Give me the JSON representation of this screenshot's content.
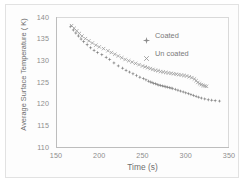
{
  "chart_data": {
    "type": "scatter",
    "title": "",
    "xlabel": "Time (s)",
    "ylabel": "Average Surface Temperature ( K)",
    "xlim": [
      150,
      350
    ],
    "ylim": [
      110,
      140
    ],
    "xticks": [
      150,
      200,
      250,
      300,
      350
    ],
    "yticks": [
      110,
      115,
      120,
      125,
      130,
      135,
      140
    ],
    "grid": false,
    "legend_position": "upper-right-inside",
    "series": [
      {
        "name": "Coated",
        "marker": "diamond",
        "color": "#808080",
        "x": [
          167,
          170,
          173,
          176,
          179,
          182,
          186,
          190,
          194,
          198,
          203,
          208,
          212,
          217,
          222,
          227,
          231,
          235,
          239,
          243,
          247,
          251,
          254,
          257,
          259,
          261,
          263,
          265,
          267,
          269,
          271,
          273,
          275,
          277,
          279,
          281,
          283,
          285,
          288,
          291,
          294,
          297,
          300,
          303,
          306,
          309,
          312,
          315,
          318,
          322,
          326,
          330,
          334,
          339
        ],
        "y": [
          137.8,
          137.0,
          136.3,
          135.6,
          134.9,
          134.3,
          133.6,
          132.9,
          132.3,
          131.8,
          131.3,
          130.7,
          130.2,
          129.4,
          128.7,
          128.2,
          127.7,
          127.3,
          126.9,
          126.5,
          126.1,
          125.8,
          125.5,
          125.2,
          125.0,
          124.9,
          124.7,
          124.6,
          124.4,
          124.3,
          124.2,
          124.1,
          124.0,
          123.9,
          123.8,
          123.7,
          123.6,
          123.5,
          123.3,
          123.1,
          122.9,
          122.7,
          122.5,
          122.3,
          122.1,
          121.9,
          121.7,
          121.5,
          121.3,
          121.1,
          120.9,
          120.8,
          120.7,
          120.6
        ]
      },
      {
        "name": "Un coated",
        "marker": "x",
        "color": "#9a9a9a",
        "x": [
          168,
          171,
          174,
          177,
          180,
          184,
          188,
          192,
          196,
          200,
          205,
          210,
          214,
          218,
          222,
          226,
          230,
          234,
          238,
          242,
          246,
          250,
          253,
          256,
          259,
          262,
          265,
          268,
          271,
          274,
          277,
          280,
          283,
          286,
          289,
          292,
          295,
          298,
          301,
          304,
          307,
          310,
          312,
          314,
          316,
          318,
          320,
          322,
          324
        ],
        "y": [
          138.0,
          137.4,
          136.8,
          136.2,
          135.6,
          135.0,
          134.5,
          134.0,
          133.5,
          133.1,
          132.7,
          132.2,
          131.8,
          131.4,
          131.0,
          130.6,
          130.2,
          129.9,
          129.6,
          129.3,
          129.0,
          128.7,
          128.5,
          128.3,
          128.1,
          127.9,
          127.7,
          127.6,
          127.4,
          127.3,
          127.2,
          127.1,
          127.0,
          126.9,
          126.8,
          126.7,
          126.6,
          126.5,
          126.4,
          126.2,
          126.0,
          125.7,
          125.3,
          124.9,
          124.6,
          124.4,
          124.2,
          124.1,
          124.0
        ]
      }
    ]
  }
}
